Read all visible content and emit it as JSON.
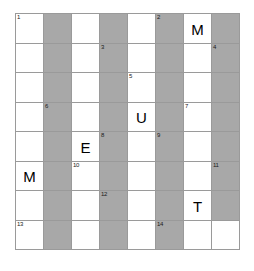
{
  "puzzle": {
    "title": "Crossword Grid",
    "rows": 8,
    "columns": 8,
    "colors": {
      "blank_cell": "#ffffff",
      "blocked_cell": "#a8a8a8",
      "grid_line": "#9a9a9a",
      "text": "#000000",
      "page_background": "#ffffff"
    },
    "cells": [
      {
        "row": 1,
        "col": 1,
        "shaded": false,
        "number": "1",
        "letter": ""
      },
      {
        "row": 1,
        "col": 2,
        "shaded": true,
        "number": "",
        "letter": ""
      },
      {
        "row": 1,
        "col": 3,
        "shaded": false,
        "number": "",
        "letter": ""
      },
      {
        "row": 1,
        "col": 4,
        "shaded": true,
        "number": "",
        "letter": ""
      },
      {
        "row": 1,
        "col": 5,
        "shaded": false,
        "number": "",
        "letter": ""
      },
      {
        "row": 1,
        "col": 6,
        "shaded": true,
        "number": "2",
        "letter": ""
      },
      {
        "row": 1,
        "col": 7,
        "shaded": false,
        "number": "",
        "letter": "M"
      },
      {
        "row": 1,
        "col": 8,
        "shaded": true,
        "number": "",
        "letter": ""
      },
      {
        "row": 2,
        "col": 1,
        "shaded": false,
        "number": "",
        "letter": ""
      },
      {
        "row": 2,
        "col": 2,
        "shaded": true,
        "number": "",
        "letter": ""
      },
      {
        "row": 2,
        "col": 3,
        "shaded": false,
        "number": "",
        "letter": ""
      },
      {
        "row": 2,
        "col": 4,
        "shaded": true,
        "number": "3",
        "letter": ""
      },
      {
        "row": 2,
        "col": 5,
        "shaded": false,
        "number": "",
        "letter": ""
      },
      {
        "row": 2,
        "col": 6,
        "shaded": true,
        "number": "",
        "letter": ""
      },
      {
        "row": 2,
        "col": 7,
        "shaded": false,
        "number": "",
        "letter": ""
      },
      {
        "row": 2,
        "col": 8,
        "shaded": true,
        "number": "4",
        "letter": ""
      },
      {
        "row": 3,
        "col": 1,
        "shaded": false,
        "number": "",
        "letter": ""
      },
      {
        "row": 3,
        "col": 2,
        "shaded": true,
        "number": "",
        "letter": ""
      },
      {
        "row": 3,
        "col": 3,
        "shaded": false,
        "number": "",
        "letter": ""
      },
      {
        "row": 3,
        "col": 4,
        "shaded": true,
        "number": "",
        "letter": ""
      },
      {
        "row": 3,
        "col": 5,
        "shaded": false,
        "number": "5",
        "letter": ""
      },
      {
        "row": 3,
        "col": 6,
        "shaded": true,
        "number": "",
        "letter": ""
      },
      {
        "row": 3,
        "col": 7,
        "shaded": false,
        "number": "",
        "letter": ""
      },
      {
        "row": 3,
        "col": 8,
        "shaded": true,
        "number": "",
        "letter": ""
      },
      {
        "row": 4,
        "col": 1,
        "shaded": false,
        "number": "",
        "letter": ""
      },
      {
        "row": 4,
        "col": 2,
        "shaded": true,
        "number": "6",
        "letter": ""
      },
      {
        "row": 4,
        "col": 3,
        "shaded": false,
        "number": "",
        "letter": ""
      },
      {
        "row": 4,
        "col": 4,
        "shaded": true,
        "number": "",
        "letter": ""
      },
      {
        "row": 4,
        "col": 5,
        "shaded": false,
        "number": "",
        "letter": "U"
      },
      {
        "row": 4,
        "col": 6,
        "shaded": true,
        "number": "",
        "letter": ""
      },
      {
        "row": 4,
        "col": 7,
        "shaded": false,
        "number": "7",
        "letter": ""
      },
      {
        "row": 4,
        "col": 8,
        "shaded": true,
        "number": "",
        "letter": ""
      },
      {
        "row": 5,
        "col": 1,
        "shaded": false,
        "number": "",
        "letter": ""
      },
      {
        "row": 5,
        "col": 2,
        "shaded": true,
        "number": "",
        "letter": ""
      },
      {
        "row": 5,
        "col": 3,
        "shaded": false,
        "number": "",
        "letter": "E"
      },
      {
        "row": 5,
        "col": 4,
        "shaded": true,
        "number": "8",
        "letter": ""
      },
      {
        "row": 5,
        "col": 5,
        "shaded": false,
        "number": "",
        "letter": ""
      },
      {
        "row": 5,
        "col": 6,
        "shaded": true,
        "number": "9",
        "letter": ""
      },
      {
        "row": 5,
        "col": 7,
        "shaded": false,
        "number": "",
        "letter": ""
      },
      {
        "row": 5,
        "col": 8,
        "shaded": true,
        "number": "",
        "letter": ""
      },
      {
        "row": 6,
        "col": 1,
        "shaded": false,
        "number": "",
        "letter": "M"
      },
      {
        "row": 6,
        "col": 2,
        "shaded": true,
        "number": "",
        "letter": ""
      },
      {
        "row": 6,
        "col": 3,
        "shaded": false,
        "number": "10",
        "letter": ""
      },
      {
        "row": 6,
        "col": 4,
        "shaded": true,
        "number": "",
        "letter": ""
      },
      {
        "row": 6,
        "col": 5,
        "shaded": false,
        "number": "",
        "letter": ""
      },
      {
        "row": 6,
        "col": 6,
        "shaded": true,
        "number": "",
        "letter": ""
      },
      {
        "row": 6,
        "col": 7,
        "shaded": false,
        "number": "",
        "letter": ""
      },
      {
        "row": 6,
        "col": 8,
        "shaded": true,
        "number": "11",
        "letter": ""
      },
      {
        "row": 7,
        "col": 1,
        "shaded": false,
        "number": "",
        "letter": ""
      },
      {
        "row": 7,
        "col": 2,
        "shaded": true,
        "number": "",
        "letter": ""
      },
      {
        "row": 7,
        "col": 3,
        "shaded": false,
        "number": "",
        "letter": ""
      },
      {
        "row": 7,
        "col": 4,
        "shaded": true,
        "number": "12",
        "letter": ""
      },
      {
        "row": 7,
        "col": 5,
        "shaded": false,
        "number": "",
        "letter": ""
      },
      {
        "row": 7,
        "col": 6,
        "shaded": true,
        "number": "",
        "letter": ""
      },
      {
        "row": 7,
        "col": 7,
        "shaded": false,
        "number": "",
        "letter": "T"
      },
      {
        "row": 7,
        "col": 8,
        "shaded": true,
        "number": "",
        "letter": ""
      },
      {
        "row": 8,
        "col": 1,
        "shaded": false,
        "number": "13",
        "letter": ""
      },
      {
        "row": 8,
        "col": 2,
        "shaded": true,
        "number": "",
        "letter": ""
      },
      {
        "row": 8,
        "col": 3,
        "shaded": false,
        "number": "",
        "letter": ""
      },
      {
        "row": 8,
        "col": 4,
        "shaded": true,
        "number": "",
        "letter": ""
      },
      {
        "row": 8,
        "col": 5,
        "shaded": false,
        "number": "",
        "letter": ""
      },
      {
        "row": 8,
        "col": 6,
        "shaded": true,
        "number": "14",
        "letter": ""
      },
      {
        "row": 8,
        "col": 7,
        "shaded": false,
        "number": "",
        "letter": ""
      },
      {
        "row": 8,
        "col": 8,
        "shaded": false,
        "number": "",
        "letter": ""
      }
    ]
  }
}
